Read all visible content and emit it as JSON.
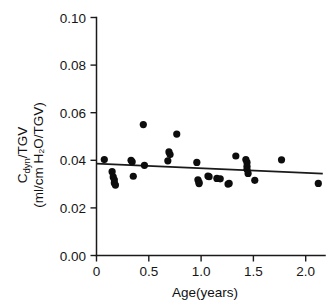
{
  "chart_data": {
    "type": "scatter",
    "title": "",
    "xlabel": "Age(years)",
    "ylabel_line1": "Cdyn/TGV",
    "ylabel_line2": "(ml/cm H2O/TGV)",
    "ylabel_main": "C",
    "ylabel_sub": "dyn",
    "ylabel_rest": "/TGV",
    "ylabel_units": "(ml/cm H₂O/TGV)",
    "xlim": [
      0.0,
      2.05
    ],
    "ylim": [
      0.0,
      0.1
    ],
    "xticks": [
      0,
      0.5,
      1.0,
      1.5,
      2.0
    ],
    "xtick_labels": [
      "0",
      "0.5",
      "1.0",
      "1.5",
      "2.0"
    ],
    "yticks": [
      0.0,
      0.02,
      0.04,
      0.06,
      0.08,
      0.1
    ],
    "ytick_labels": [
      "0.00",
      "0.02",
      "0.04",
      "0.06",
      "0.08",
      "0.10"
    ],
    "grid": false,
    "legend": "none",
    "marker": "filled-circle",
    "marker_color": "#0d0d0d",
    "marker_size_px": 7.2,
    "x": [
      0.07,
      0.14,
      0.15,
      0.16,
      0.16,
      0.17,
      0.31,
      0.32,
      0.33,
      0.42,
      0.43,
      0.64,
      0.65,
      0.66,
      0.72,
      0.9,
      0.91,
      0.92,
      0.92,
      1.0,
      1.01,
      1.08,
      1.11,
      1.18,
      1.19,
      1.25,
      1.34,
      1.35,
      1.35,
      1.35,
      1.36,
      1.42,
      1.66,
      1.99
    ],
    "y": [
      0.0403,
      0.0352,
      0.033,
      0.0318,
      0.0305,
      0.0296,
      0.04,
      0.0394,
      0.0333,
      0.055,
      0.0379,
      0.0398,
      0.0435,
      0.0424,
      0.051,
      0.0391,
      0.0318,
      0.0307,
      0.0302,
      0.0334,
      0.0331,
      0.0324,
      0.0322,
      0.03,
      0.0303,
      0.0418,
      0.0403,
      0.0391,
      0.0375,
      0.0362,
      0.0345,
      0.0316,
      0.0402,
      0.0303
    ],
    "series": [
      {
        "name": "Cdyn/TGV vs Age",
        "points": [
          {
            "x": 0.07,
            "y": 0.0403
          },
          {
            "x": 0.14,
            "y": 0.0352
          },
          {
            "x": 0.15,
            "y": 0.033
          },
          {
            "x": 0.16,
            "y": 0.0318
          },
          {
            "x": 0.16,
            "y": 0.0305
          },
          {
            "x": 0.17,
            "y": 0.0296
          },
          {
            "x": 0.31,
            "y": 0.04
          },
          {
            "x": 0.32,
            "y": 0.0394
          },
          {
            "x": 0.33,
            "y": 0.0333
          },
          {
            "x": 0.42,
            "y": 0.055
          },
          {
            "x": 0.43,
            "y": 0.0379
          },
          {
            "x": 0.64,
            "y": 0.0398
          },
          {
            "x": 0.65,
            "y": 0.0435
          },
          {
            "x": 0.66,
            "y": 0.0424
          },
          {
            "x": 0.72,
            "y": 0.051
          },
          {
            "x": 0.9,
            "y": 0.0391
          },
          {
            "x": 0.91,
            "y": 0.0318
          },
          {
            "x": 0.92,
            "y": 0.0307
          },
          {
            "x": 0.92,
            "y": 0.0302
          },
          {
            "x": 1.0,
            "y": 0.0334
          },
          {
            "x": 1.01,
            "y": 0.0331
          },
          {
            "x": 1.08,
            "y": 0.0324
          },
          {
            "x": 1.11,
            "y": 0.0322
          },
          {
            "x": 1.18,
            "y": 0.03
          },
          {
            "x": 1.19,
            "y": 0.0303
          },
          {
            "x": 1.25,
            "y": 0.0418
          },
          {
            "x": 1.34,
            "y": 0.0403
          },
          {
            "x": 1.35,
            "y": 0.0391
          },
          {
            "x": 1.35,
            "y": 0.0375
          },
          {
            "x": 1.35,
            "y": 0.0362
          },
          {
            "x": 1.36,
            "y": 0.0345
          },
          {
            "x": 1.42,
            "y": 0.0316
          },
          {
            "x": 1.66,
            "y": 0.0402
          },
          {
            "x": 1.99,
            "y": 0.0303
          }
        ]
      }
    ],
    "fit_line": {
      "name": "regression-line",
      "x0": 0.0,
      "y0": 0.0386,
      "x1": 2.03,
      "y1": 0.0344,
      "color": "#1a1a1a"
    }
  }
}
